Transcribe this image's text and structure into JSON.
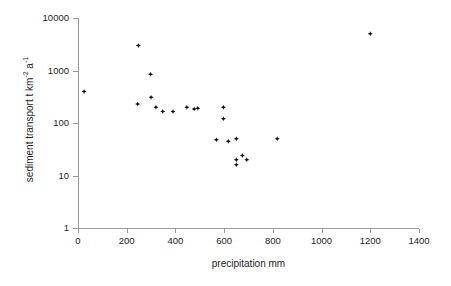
{
  "chart_data": {
    "type": "scatter",
    "title": "",
    "xlabel": "precipitation mm",
    "ylabel": "sediment transport  t km-2 a-1",
    "ylabel_parts": {
      "main": "sediment transport  t km",
      "sup1": "-2",
      "mid": " a",
      "sup2": "-1"
    },
    "xlim": [
      0,
      1400
    ],
    "ylim": [
      1,
      10000
    ],
    "yscale": "log",
    "xscale": "linear",
    "grid": false,
    "legend": null,
    "xticks": [
      0,
      200,
      400,
      600,
      800,
      1000,
      1200,
      1400
    ],
    "xtick_labels": [
      "0",
      "200",
      "400",
      "600",
      "800",
      "1000",
      "1200",
      "1400"
    ],
    "yticks": [
      1,
      10,
      100,
      1000,
      10000
    ],
    "ytick_labels": [
      "1",
      "10",
      "100",
      "1000",
      "10000"
    ],
    "marker_color": "#111111",
    "marker_shape": "diamond",
    "points": [
      {
        "x": 25,
        "y": 400
      },
      {
        "x": 248,
        "y": 3000
      },
      {
        "x": 245,
        "y": 230
      },
      {
        "x": 298,
        "y": 850
      },
      {
        "x": 300,
        "y": 310
      },
      {
        "x": 320,
        "y": 200
      },
      {
        "x": 348,
        "y": 165
      },
      {
        "x": 390,
        "y": 165
      },
      {
        "x": 447,
        "y": 200
      },
      {
        "x": 477,
        "y": 185
      },
      {
        "x": 492,
        "y": 190
      },
      {
        "x": 597,
        "y": 200
      },
      {
        "x": 597,
        "y": 120
      },
      {
        "x": 568,
        "y": 48
      },
      {
        "x": 617,
        "y": 45
      },
      {
        "x": 650,
        "y": 50
      },
      {
        "x": 650,
        "y": 20
      },
      {
        "x": 650,
        "y": 16
      },
      {
        "x": 675,
        "y": 24
      },
      {
        "x": 693,
        "y": 20
      },
      {
        "x": 818,
        "y": 50
      },
      {
        "x": 1200,
        "y": 5000
      }
    ]
  }
}
